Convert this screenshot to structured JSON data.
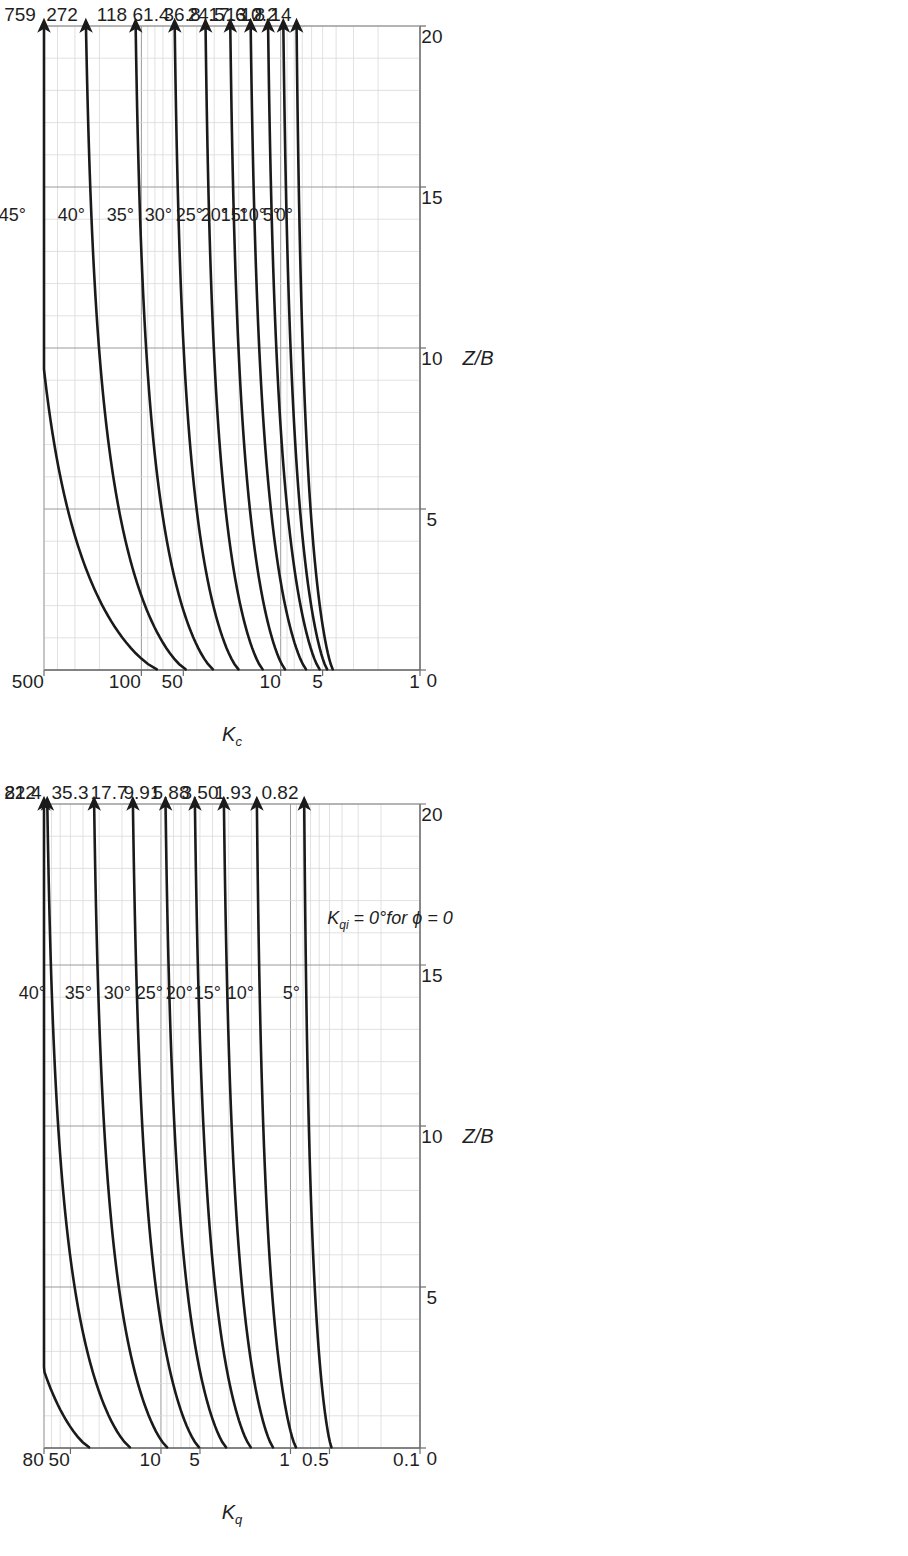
{
  "figure": {
    "background_color": "#ffffff",
    "line_color": "#1a1a1a",
    "grid_major_color": "#9a9a9a",
    "grid_minor_color": "#d9d9d9",
    "orientation": "rotated-90-ccw"
  },
  "chart_data": [
    {
      "id": "kc",
      "type": "line",
      "title": "",
      "xlabel": "Z/B",
      "ylabel": "Kc",
      "ylabel_plain": "Kc",
      "xlim": [
        0,
        20
      ],
      "ylim": [
        1,
        500
      ],
      "yscale": "log",
      "xticks": [
        "0",
        "5",
        "10",
        "15",
        "20"
      ],
      "xtick_values": [
        0,
        5,
        10,
        15,
        20
      ],
      "yticks": [
        "1",
        "5",
        "10",
        "50",
        "100",
        "500"
      ],
      "ytick_values": [
        1,
        5,
        10,
        50,
        100,
        500
      ],
      "grid": true,
      "legend": "inline-curve-labels",
      "note": "",
      "series": [
        {
          "name": "45°",
          "end_label": "759",
          "end_value": 759,
          "start_value": 75.0
        },
        {
          "name": "40°",
          "end_label": "272",
          "end_value": 272,
          "start_value": 47.0
        },
        {
          "name": "35°",
          "end_label": "118",
          "end_value": 118,
          "start_value": 30.1
        },
        {
          "name": "30°",
          "end_label": "61.4",
          "end_value": 61.4,
          "start_value": 19.8
        },
        {
          "name": "25°",
          "end_label": "36.8",
          "end_value": 36.8,
          "start_value": 13.3
        },
        {
          "name": "20°",
          "end_label": "24.5",
          "end_value": 24.5,
          "start_value": 9.2
        },
        {
          "name": "15°",
          "end_label": "17.6",
          "end_value": 17.6,
          "start_value": 6.5
        },
        {
          "name": "10°",
          "end_label": "13.2",
          "end_value": 13.2,
          "start_value": 5.2
        },
        {
          "name": "5°",
          "end_label": "10.2",
          "end_value": 10.2,
          "start_value": 4.6
        },
        {
          "name": "0°",
          "end_label": "8.14",
          "end_value": 8.14,
          "start_value": 4.2
        }
      ]
    },
    {
      "id": "kq",
      "type": "line",
      "title": "",
      "xlabel": "Z/B",
      "ylabel": "Kq",
      "ylabel_plain": "Kq",
      "xlim": [
        0,
        20
      ],
      "ylim": [
        0.1,
        80
      ],
      "yscale": "log",
      "xticks": [
        "0",
        "5",
        "10",
        "15",
        "20"
      ],
      "xtick_values": [
        0,
        5,
        10,
        15,
        20
      ],
      "yticks": [
        "0.1",
        "0.5",
        "1",
        "5",
        "10",
        "50",
        "80"
      ],
      "ytick_values": [
        0.1,
        0.5,
        1,
        5,
        10,
        50,
        80
      ],
      "grid": true,
      "legend": "inline-curve-labels",
      "note": "K_qi = 0° for ϕ = 0",
      "series": [
        {
          "name": "45°",
          "end_label": "222",
          "end_value": 222,
          "start_value": 35.0
        },
        {
          "name": "40°",
          "end_label": "81.4",
          "end_value": 81.4,
          "start_value": 17.0
        },
        {
          "name": "35°",
          "end_label": "35.3",
          "end_value": 35.3,
          "start_value": 8.8
        },
        {
          "name": "30°",
          "end_label": "17.7",
          "end_value": 17.7,
          "start_value": 5.0
        },
        {
          "name": "25°",
          "end_label": "9.91",
          "end_value": 9.91,
          "start_value": 3.1
        },
        {
          "name": "20°",
          "end_label": "5.88",
          "end_value": 5.88,
          "start_value": 2.0
        },
        {
          "name": "15°",
          "end_label": "3.50",
          "end_value": 3.5,
          "start_value": 1.35
        },
        {
          "name": "10°",
          "end_label": "1.93",
          "end_value": 1.93,
          "start_value": 0.9
        },
        {
          "name": "5°",
          "end_label": "0.82",
          "end_value": 0.82,
          "start_value": 0.48
        }
      ]
    }
  ],
  "kc": {
    "axis": {
      "x_title": "Z/B",
      "y_title_main": "K",
      "y_title_sub": "c"
    },
    "xticks": [
      {
        "label": "0"
      },
      {
        "label": "5"
      },
      {
        "label": "10"
      },
      {
        "label": "15"
      },
      {
        "label": "20"
      }
    ],
    "yticks": [
      {
        "label": "500"
      },
      {
        "label": "100"
      },
      {
        "label": "50"
      },
      {
        "label": "10"
      },
      {
        "label": "5"
      },
      {
        "label": "1"
      }
    ],
    "end_labels": [
      {
        "label": "759"
      },
      {
        "label": "272"
      },
      {
        "label": "118"
      },
      {
        "label": "61.4"
      },
      {
        "label": "36.8"
      },
      {
        "label": "24.5"
      },
      {
        "label": "17.6"
      },
      {
        "label": "13.2"
      },
      {
        "label": "10.2"
      },
      {
        "label": "8.14"
      }
    ],
    "curve_labels": [
      {
        "label": "45°"
      },
      {
        "label": "40°"
      },
      {
        "label": "35°"
      },
      {
        "label": "30°"
      },
      {
        "label": "25°"
      },
      {
        "label": "20°"
      },
      {
        "label": "15°"
      },
      {
        "label": "10°"
      },
      {
        "label": "5°"
      },
      {
        "label": "0°"
      }
    ]
  },
  "kq": {
    "axis": {
      "x_title": "Z/B",
      "y_title_main": "K",
      "y_title_sub": "q"
    },
    "note": {
      "main": "K",
      "sub": "qi",
      "rest": " = 0°for ϕ = 0"
    },
    "xticks": [
      {
        "label": "0"
      },
      {
        "label": "5"
      },
      {
        "label": "10"
      },
      {
        "label": "15"
      },
      {
        "label": "20"
      }
    ],
    "yticks": [
      {
        "label": "80"
      },
      {
        "label": "50"
      },
      {
        "label": "10"
      },
      {
        "label": "5"
      },
      {
        "label": "1"
      },
      {
        "label": "0.5"
      },
      {
        "label": "0.1"
      }
    ],
    "end_labels": [
      {
        "label": "222"
      },
      {
        "label": "81.4"
      },
      {
        "label": "35.3"
      },
      {
        "label": "17.7"
      },
      {
        "label": "9.91"
      },
      {
        "label": "5.88"
      },
      {
        "label": "3.50"
      },
      {
        "label": "1.93"
      },
      {
        "label": "0.82"
      }
    ],
    "curve_labels": [
      {
        "label": "45°"
      },
      {
        "label": "40°"
      },
      {
        "label": "35°"
      },
      {
        "label": "30°"
      },
      {
        "label": "25°"
      },
      {
        "label": "20°"
      },
      {
        "label": "15°"
      },
      {
        "label": "10°"
      },
      {
        "label": "5°"
      }
    ]
  }
}
